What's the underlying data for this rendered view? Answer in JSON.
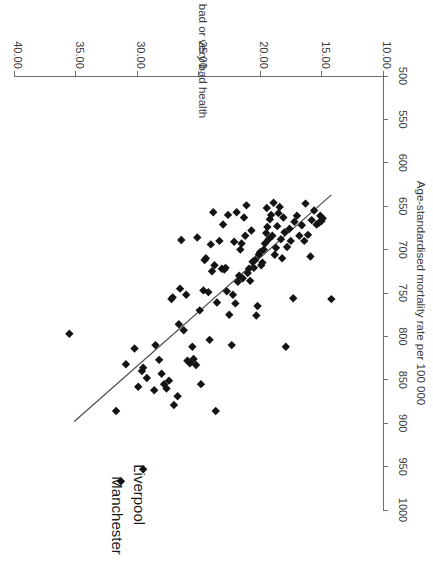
{
  "chart_data": {
    "type": "scatter",
    "title": "",
    "xlabel": "% reporting bad or very bad health",
    "ylabel": "Age-standardised mortality rate per 100 000",
    "xlim": [
      10.0,
      40.0
    ],
    "ylim": [
      500,
      1000
    ],
    "xticks": [
      "10.00",
      "15.00",
      "20.00",
      "25.00",
      "30.00",
      "35.00",
      "40.00"
    ],
    "xtick_values": [
      10,
      15,
      20,
      25,
      30,
      35,
      40
    ],
    "yticks": [
      "500",
      "550",
      "600",
      "650",
      "700",
      "750",
      "800",
      "850",
      "900",
      "950",
      "1000"
    ],
    "ytick_values": [
      500,
      550,
      600,
      650,
      700,
      750,
      800,
      850,
      900,
      950,
      1000
    ],
    "grid": false,
    "legend": "none",
    "orientation": "rotated-180",
    "marker_shape": "diamond",
    "marker_color": "#141414",
    "trendline": {
      "label": "linear fit",
      "color": "#4a4a4a",
      "x_start": 14.2,
      "y_start": 637,
      "x_end": 35.1,
      "y_end": 898
    },
    "annotations": [
      {
        "label": "Manchester",
        "x": 31.3,
        "y": 967
      },
      {
        "label": "Liverpool",
        "x": 29.5,
        "y": 953
      }
    ],
    "points": [
      {
        "x": 31.3,
        "y": 967,
        "name": "Manchester"
      },
      {
        "x": 29.5,
        "y": 953,
        "name": "Liverpool"
      },
      {
        "x": 35.5,
        "y": 797
      },
      {
        "x": 31.7,
        "y": 886
      },
      {
        "x": 30.9,
        "y": 832
      },
      {
        "x": 30.2,
        "y": 814
      },
      {
        "x": 29.9,
        "y": 858
      },
      {
        "x": 29.6,
        "y": 840
      },
      {
        "x": 29.5,
        "y": 836
      },
      {
        "x": 29.2,
        "y": 848
      },
      {
        "x": 28.6,
        "y": 862
      },
      {
        "x": 28.5,
        "y": 810
      },
      {
        "x": 28.0,
        "y": 843
      },
      {
        "x": 27.8,
        "y": 855
      },
      {
        "x": 27.6,
        "y": 860
      },
      {
        "x": 27.4,
        "y": 851
      },
      {
        "x": 27.2,
        "y": 757
      },
      {
        "x": 27.1,
        "y": 755
      },
      {
        "x": 26.7,
        "y": 869
      },
      {
        "x": 26.6,
        "y": 786
      },
      {
        "x": 26.5,
        "y": 745
      },
      {
        "x": 26.4,
        "y": 689
      },
      {
        "x": 26.2,
        "y": 793
      },
      {
        "x": 25.9,
        "y": 828
      },
      {
        "x": 25.7,
        "y": 831
      },
      {
        "x": 25.5,
        "y": 812
      },
      {
        "x": 25.4,
        "y": 826
      },
      {
        "x": 25.2,
        "y": 833
      },
      {
        "x": 24.9,
        "y": 770
      },
      {
        "x": 24.8,
        "y": 855
      },
      {
        "x": 24.6,
        "y": 747
      },
      {
        "x": 24.5,
        "y": 712
      },
      {
        "x": 24.4,
        "y": 710
      },
      {
        "x": 24.2,
        "y": 749
      },
      {
        "x": 24.1,
        "y": 804
      },
      {
        "x": 23.9,
        "y": 725
      },
      {
        "x": 23.7,
        "y": 718
      },
      {
        "x": 23.6,
        "y": 886
      },
      {
        "x": 23.5,
        "y": 761
      },
      {
        "x": 23.3,
        "y": 690
      },
      {
        "x": 23.1,
        "y": 722
      },
      {
        "x": 22.9,
        "y": 723
      },
      {
        "x": 22.8,
        "y": 721
      },
      {
        "x": 22.6,
        "y": 660
      },
      {
        "x": 22.5,
        "y": 775
      },
      {
        "x": 22.3,
        "y": 810
      },
      {
        "x": 22.2,
        "y": 752
      },
      {
        "x": 22.0,
        "y": 762
      },
      {
        "x": 21.8,
        "y": 737
      },
      {
        "x": 21.7,
        "y": 730
      },
      {
        "x": 21.6,
        "y": 700
      },
      {
        "x": 21.5,
        "y": 693
      },
      {
        "x": 21.4,
        "y": 733
      },
      {
        "x": 21.3,
        "y": 663
      },
      {
        "x": 21.2,
        "y": 684
      },
      {
        "x": 21.1,
        "y": 649
      },
      {
        "x": 21.0,
        "y": 727
      },
      {
        "x": 20.9,
        "y": 722
      },
      {
        "x": 20.8,
        "y": 736
      },
      {
        "x": 20.6,
        "y": 714
      },
      {
        "x": 20.5,
        "y": 721
      },
      {
        "x": 20.4,
        "y": 712
      },
      {
        "x": 20.3,
        "y": 776
      },
      {
        "x": 20.2,
        "y": 765
      },
      {
        "x": 20.1,
        "y": 706
      },
      {
        "x": 20.0,
        "y": 703
      },
      {
        "x": 19.9,
        "y": 718
      },
      {
        "x": 19.8,
        "y": 715
      },
      {
        "x": 19.7,
        "y": 700
      },
      {
        "x": 19.6,
        "y": 693
      },
      {
        "x": 19.5,
        "y": 681
      },
      {
        "x": 19.4,
        "y": 674
      },
      {
        "x": 19.3,
        "y": 688
      },
      {
        "x": 19.2,
        "y": 665
      },
      {
        "x": 19.1,
        "y": 660
      },
      {
        "x": 19.0,
        "y": 684
      },
      {
        "x": 18.8,
        "y": 706
      },
      {
        "x": 18.7,
        "y": 698
      },
      {
        "x": 18.6,
        "y": 673
      },
      {
        "x": 18.5,
        "y": 658
      },
      {
        "x": 18.4,
        "y": 651
      },
      {
        "x": 18.3,
        "y": 688
      },
      {
        "x": 18.2,
        "y": 710
      },
      {
        "x": 18.1,
        "y": 663
      },
      {
        "x": 18.0,
        "y": 680
      },
      {
        "x": 17.9,
        "y": 812
      },
      {
        "x": 17.8,
        "y": 697
      },
      {
        "x": 17.6,
        "y": 676
      },
      {
        "x": 17.5,
        "y": 690
      },
      {
        "x": 17.3,
        "y": 756
      },
      {
        "x": 17.2,
        "y": 668
      },
      {
        "x": 17.0,
        "y": 661
      },
      {
        "x": 16.8,
        "y": 684
      },
      {
        "x": 16.6,
        "y": 672
      },
      {
        "x": 16.4,
        "y": 690
      },
      {
        "x": 16.3,
        "y": 647
      },
      {
        "x": 16.1,
        "y": 683
      },
      {
        "x": 15.9,
        "y": 708
      },
      {
        "x": 15.8,
        "y": 666
      },
      {
        "x": 15.6,
        "y": 655
      },
      {
        "x": 15.4,
        "y": 671
      },
      {
        "x": 15.2,
        "y": 669
      },
      {
        "x": 15.1,
        "y": 661
      },
      {
        "x": 15.0,
        "y": 667
      },
      {
        "x": 14.9,
        "y": 664
      },
      {
        "x": 14.2,
        "y": 757
      },
      {
        "x": 24.0,
        "y": 694
      },
      {
        "x": 22.7,
        "y": 748
      },
      {
        "x": 25.1,
        "y": 686
      },
      {
        "x": 23.0,
        "y": 671
      },
      {
        "x": 20.7,
        "y": 678
      },
      {
        "x": 19.45,
        "y": 652
      },
      {
        "x": 18.9,
        "y": 646
      },
      {
        "x": 21.9,
        "y": 657
      },
      {
        "x": 23.8,
        "y": 657
      },
      {
        "x": 22.1,
        "y": 691
      },
      {
        "x": 26.0,
        "y": 752
      },
      {
        "x": 27.0,
        "y": 879
      },
      {
        "x": 28.2,
        "y": 827
      }
    ]
  },
  "axes": {
    "x_axis_name": "x-axis",
    "y_axis_name": "y-axis"
  }
}
